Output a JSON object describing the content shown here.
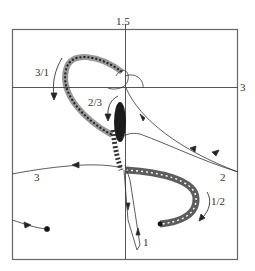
{
  "figure": {
    "axis_labels": {
      "top": "1.5",
      "right": "3"
    },
    "curve_labels": [
      {
        "id": "c31",
        "text": "3/1"
      },
      {
        "id": "c23",
        "text": "2/3"
      },
      {
        "id": "c12",
        "text": "1/2"
      },
      {
        "id": "c1",
        "text": "1"
      },
      {
        "id": "c2",
        "text": "2"
      },
      {
        "id": "c3",
        "text": "3"
      }
    ],
    "colors": {
      "frame": "#555555",
      "curve": "#333333",
      "spiral": "#222222"
    }
  }
}
